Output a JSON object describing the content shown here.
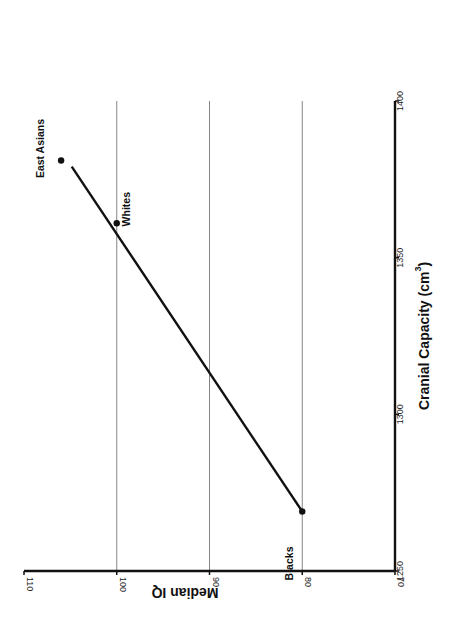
{
  "chart_data": {
    "type": "scatter",
    "orientation": "page rotated 90 degrees clockwise",
    "title": "",
    "xlabel": "Cranial Capacity (cm³)",
    "ylabel": "Median IQ",
    "xlim": [
      1250,
      1400
    ],
    "ylim": [
      70,
      110
    ],
    "x_ticks": [
      1250,
      1300,
      1350,
      1400
    ],
    "y_ticks": [
      70,
      80,
      90,
      100,
      110
    ],
    "grid": {
      "horizontal_at_y": [
        80,
        90,
        100
      ],
      "vertical": false
    },
    "legend": null,
    "series": [
      {
        "name": "Groups",
        "points": [
          {
            "label": "Blacks",
            "x": 1269,
            "y": 80
          },
          {
            "label": "Whites",
            "x": 1361,
            "y": 100
          },
          {
            "label": "East Asians",
            "x": 1381,
            "y": 106
          }
        ]
      }
    ],
    "trendline": {
      "from": {
        "x": 1269,
        "y": 80
      },
      "to": {
        "x": 1380,
        "y": 105.5
      }
    }
  },
  "labels": {
    "x_axis_title": "Cranial Capacity (cm",
    "x_axis_sup": "3",
    "x_axis_close": ")",
    "y_axis_title": "Median IQ"
  }
}
